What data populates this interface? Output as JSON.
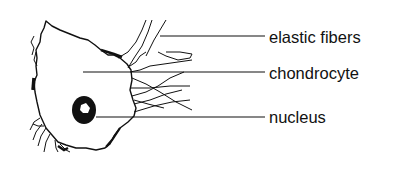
{
  "diagram": {
    "labels": [
      {
        "id": "elastic-fibers",
        "text": "elastic fibers",
        "leader_y": 36
      },
      {
        "id": "chondrocyte",
        "text": "chondrocyte",
        "leader_y": 72
      },
      {
        "id": "nucleus",
        "text": "nucleus",
        "leader_y": 117
      }
    ],
    "colors": {
      "ink": "#111111",
      "background": "#ffffff"
    }
  }
}
